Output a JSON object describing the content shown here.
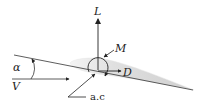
{
  "diagram": {
    "type": "airfoil-forces",
    "labels": {
      "lift": "L",
      "moment": "M",
      "drag": "D",
      "angle_of_attack": "α",
      "freestream_velocity": "V",
      "aerodynamic_center": "a.c"
    },
    "colors": {
      "line": "#222222",
      "airfoil_fill": "#d8d8d8",
      "airfoil_light": "#f2f2f2"
    }
  }
}
